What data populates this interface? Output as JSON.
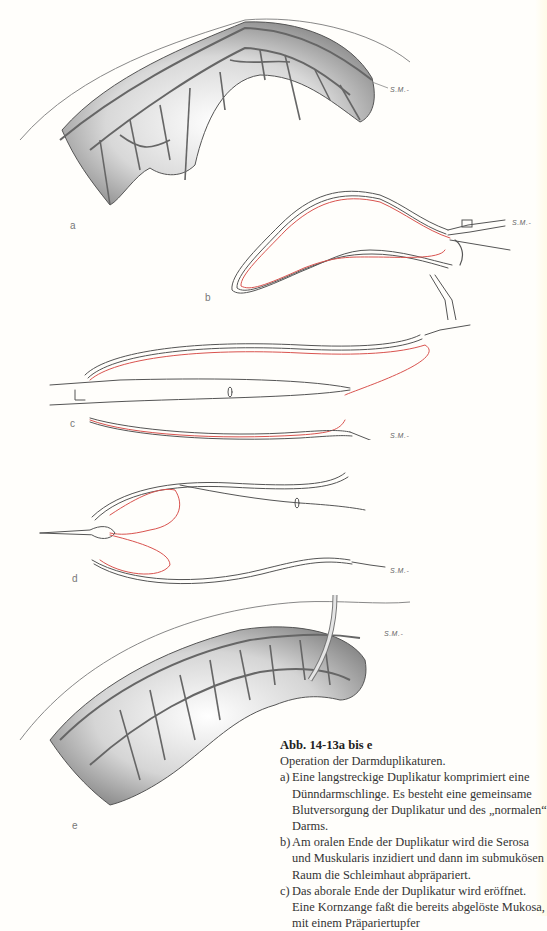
{
  "figure": {
    "panels": [
      {
        "id": "a",
        "label": "a",
        "signature": "S.M.-",
        "type": "shaded-illustration",
        "subject": "long duplication compressing small bowel loop with mesenteric vessels"
      },
      {
        "id": "b",
        "label": "b",
        "signature": "S.M.-",
        "type": "line-drawing",
        "subject": "seromuscular incision at oral end, clamps, red mucosa line"
      },
      {
        "id": "c",
        "label": "c",
        "signature": "S.M.-",
        "type": "line-drawing",
        "subject": "aboral end opened, forceps grasping mucosa"
      },
      {
        "id": "d",
        "label": "d",
        "signature": "S.M.-",
        "type": "line-drawing",
        "subject": "mucosa pulled through with forceps"
      },
      {
        "id": "e",
        "label": "e",
        "signature": "S.M.-",
        "type": "shaded-illustration",
        "subject": "bowel with drain after mucosa removal"
      }
    ],
    "colors": {
      "line": "#555555",
      "mucosa_red": "#d9534f",
      "background": "#fffefb"
    }
  },
  "caption": {
    "title": "Abb. 14-13a bis e",
    "subtitle": "Operation der Darmduplikaturen.",
    "items": [
      {
        "mark": "a)",
        "text": "Eine langstreckige Duplikatur komprimiert eine Dünndarmschlinge. Es besteht eine gemeinsame Blutversorgung der Duplikatur und des „normalen“ Darms."
      },
      {
        "mark": "b)",
        "text": "Am oralen Ende der Duplikatur wird die Serosa und Muskularis inzidiert und dann im submukösen Raum die Schleimhaut abpräpariert."
      },
      {
        "mark": "c)",
        "text": "Das aborale Ende der Duplikatur wird eröffnet. Eine Kornzange faßt die bereits abgelöste Mukosa, mit einem Präpariertupfer"
      }
    ]
  }
}
